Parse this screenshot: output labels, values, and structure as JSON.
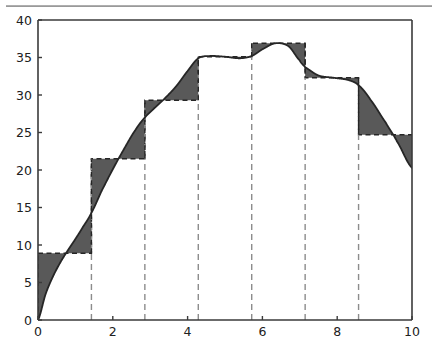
{
  "figure": {
    "title": "",
    "background_color": "#ffffff",
    "top_rule_color": "#9a9a9a",
    "axes_color": "#3a3a3a",
    "curve_color": "#262626",
    "fill_color": "#595959",
    "step_color": "#262626",
    "bin_divider_color": "#8c8c8c",
    "bin_divider_style": "dashed"
  },
  "chart_data": {
    "type": "area",
    "title": "",
    "xlabel": "",
    "ylabel": "",
    "xlim": [
      0,
      10
    ],
    "ylim": [
      0,
      40
    ],
    "grid": false,
    "legend": null,
    "x_ticks": [
      0,
      2,
      4,
      6,
      8,
      10
    ],
    "x_tick_labels": [
      "0",
      "2",
      "4",
      "6",
      "8",
      "10"
    ],
    "y_ticks": [
      0,
      5,
      10,
      15,
      20,
      25,
      30,
      35,
      40
    ],
    "y_tick_labels": [
      "0",
      "5",
      "10",
      "15",
      "20",
      "25",
      "30",
      "35",
      "40"
    ],
    "bin_edges": [
      0,
      1.4286,
      2.8571,
      4.2857,
      5.7143,
      7.1429,
      8.5714,
      10
    ],
    "n_bins": 7,
    "series": [
      {
        "name": "step-averages",
        "type": "step",
        "categories": [
          "0-1.43",
          "1.43-2.86",
          "2.86-4.29",
          "4.29-5.71",
          "5.71-7.14",
          "7.14-8.57",
          "8.57-10"
        ],
        "values": [
          8.9,
          21.5,
          29.3,
          35.1,
          36.9,
          32.3,
          24.7
        ]
      },
      {
        "name": "smooth-curve",
        "type": "line",
        "x": [
          0.0,
          0.2,
          0.4,
          0.6,
          0.8,
          1.0,
          1.2,
          1.4286,
          1.7,
          2.0,
          2.3,
          2.6,
          2.8571,
          3.1,
          3.4,
          3.7,
          4.0,
          4.2857,
          4.6,
          5.0,
          5.4,
          5.7143,
          6.0,
          6.35,
          6.7,
          7.0,
          7.1429,
          7.5,
          7.9,
          8.3,
          8.5714,
          8.9,
          9.3,
          9.6,
          10.0
        ],
        "y": [
          0.0,
          3.4,
          5.8,
          7.7,
          9.3,
          10.8,
          12.4,
          14.3,
          17.2,
          20.1,
          22.8,
          25.3,
          27.0,
          28.2,
          29.6,
          31.2,
          33.2,
          34.9,
          35.2,
          35.1,
          34.9,
          35.2,
          36.1,
          36.9,
          36.5,
          34.6,
          33.7,
          32.6,
          32.3,
          32.0,
          31.3,
          29.3,
          26.3,
          23.8,
          20.3
        ]
      }
    ]
  }
}
